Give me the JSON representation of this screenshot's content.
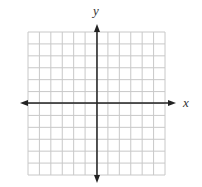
{
  "diagram": {
    "type": "coordinate-plane",
    "grid": {
      "left": 28,
      "top": 32,
      "right": 165,
      "bottom": 175,
      "columns": 12,
      "rows": 12,
      "line_color": "#c8c8c8"
    },
    "axes": {
      "color": "#222222",
      "x_axis_y": 103,
      "y_axis_x": 97,
      "x_start": 20,
      "x_end": 176,
      "y_start": 24,
      "y_end": 183,
      "x_label": "x",
      "y_label": "y"
    }
  }
}
